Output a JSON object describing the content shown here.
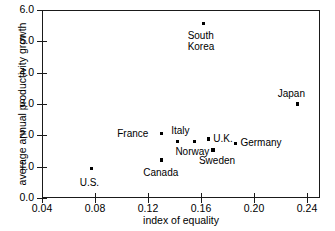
{
  "chart_data": {
    "type": "scatter",
    "title": "",
    "xlabel": "index of equality",
    "ylabel": "average annual productivity growth",
    "xlim": [
      0.04,
      0.2575
    ],
    "ylim": [
      0.0,
      6.0
    ],
    "xticks": [
      "0.04",
      "0.08",
      "0.12",
      "0.16",
      "0.20",
      "0.24"
    ],
    "xtick_values": [
      0.04,
      0.08,
      0.12,
      0.16,
      0.2,
      0.24
    ],
    "yticks": [
      "0.0",
      "1.0",
      "2.0",
      "3.0",
      "4.0",
      "5.0",
      "6.0"
    ],
    "ytick_values": [
      0.0,
      1.0,
      2.0,
      3.0,
      4.0,
      5.0,
      6.0
    ],
    "grid": false,
    "legend": false,
    "marker_color": "#000000",
    "points": [
      {
        "label": "U.S.",
        "x": 0.0775,
        "y": 0.93,
        "label_dx": -12,
        "label_dy": 8
      },
      {
        "label": "Canada",
        "x": 0.13,
        "y": 1.21,
        "label_dx": -18,
        "label_dy": 7
      },
      {
        "label": "France",
        "x": 0.13,
        "y": 2.05,
        "label_dx": -44,
        "label_dy": -6
      },
      {
        "label": "Italy",
        "x": 0.142,
        "y": 1.81,
        "label_dx": -6,
        "label_dy": -16
      },
      {
        "label": "Norway",
        "x": 0.155,
        "y": 1.81,
        "label_dx": -19,
        "label_dy": 5
      },
      {
        "label": "South\nKorea",
        "x": 0.162,
        "y": 5.58,
        "label_dx": -16,
        "label_dy": 7
      },
      {
        "label": "U.K.",
        "x": 0.1655,
        "y": 1.88,
        "label_dx": 5,
        "label_dy": -6
      },
      {
        "label": "Sweden",
        "x": 0.169,
        "y": 1.53,
        "label_dx": -14,
        "label_dy": 5
      },
      {
        "label": "Germany",
        "x": 0.186,
        "y": 1.75,
        "label_dx": 5,
        "label_dy": -6
      },
      {
        "label": "Japan",
        "x": 0.233,
        "y": 3.0,
        "label_dx": -20,
        "label_dy": -16
      }
    ]
  }
}
